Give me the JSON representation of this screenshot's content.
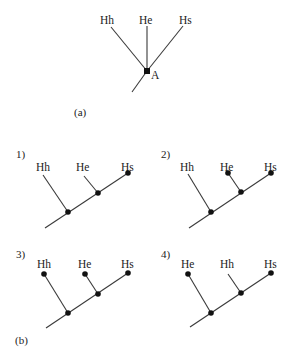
{
  "figure_a": {
    "caption": "(a)",
    "taxa": [
      "Hh",
      "He",
      "Hs"
    ],
    "node_label": "A"
  },
  "figure_b": {
    "caption": "(b)",
    "trees": [
      {
        "number": "1)",
        "taxa": [
          "Hh",
          "He",
          "Hs"
        ],
        "dotted_tips": [
          "Hs"
        ]
      },
      {
        "number": "2)",
        "taxa": [
          "Hh",
          "He",
          "Hs"
        ],
        "dotted_tips": [
          "He",
          "Hs"
        ]
      },
      {
        "number": "3)",
        "taxa": [
          "Hh",
          "He",
          "Hs"
        ],
        "dotted_tips": [
          "Hh",
          "He",
          "Hs"
        ]
      },
      {
        "number": "4)",
        "taxa": [
          "He",
          "Hh",
          "Hs"
        ],
        "dotted_tips": [
          "He",
          "Hs"
        ]
      }
    ]
  }
}
